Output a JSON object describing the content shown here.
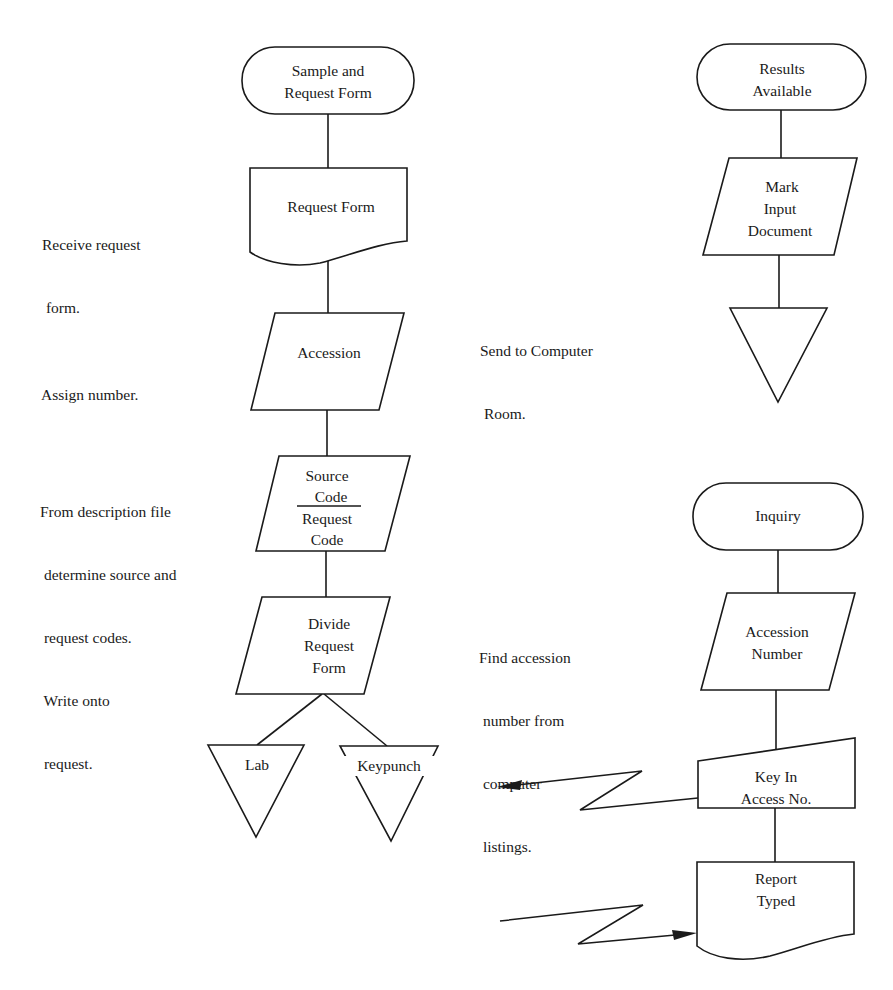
{
  "diagram": {
    "type": "flowchart",
    "palette": {
      "stroke": "#1a1a1a",
      "background": "#ffffff"
    },
    "left_flow": {
      "nodes": [
        {
          "id": "sample-request",
          "shape": "terminal",
          "lines": [
            "Sample and",
            "Request Form"
          ]
        },
        {
          "id": "request-form",
          "shape": "document",
          "lines": [
            "Request Form"
          ]
        },
        {
          "id": "accession",
          "shape": "parallelogram",
          "lines": [
            "Accession"
          ]
        },
        {
          "id": "source-request-code",
          "shape": "parallelogram",
          "lines": [
            "Source",
            "Code",
            "Request",
            "Code"
          ],
          "divider_after_line": 2
        },
        {
          "id": "divide-request-form",
          "shape": "parallelogram",
          "lines": [
            "Divide",
            "Request",
            "Form"
          ]
        },
        {
          "id": "lab",
          "shape": "offline-storage",
          "lines": [
            "Lab"
          ]
        },
        {
          "id": "keypunch",
          "shape": "offline-storage",
          "lines": [
            "Keypunch"
          ]
        }
      ],
      "notes": [
        {
          "id": "note-receive",
          "lines": [
            "Receive request",
            " form."
          ]
        },
        {
          "id": "note-assign",
          "lines": [
            "Assign number."
          ]
        },
        {
          "id": "note-description",
          "lines": [
            "From description file",
            " determine source and",
            " request codes.",
            " Write onto",
            " request."
          ]
        }
      ]
    },
    "right_flow_top": {
      "nodes": [
        {
          "id": "results-available",
          "shape": "terminal",
          "lines": [
            "Results",
            "Available"
          ]
        },
        {
          "id": "mark-input-document",
          "shape": "parallelogram",
          "lines": [
            "Mark",
            "Input",
            "Document"
          ]
        },
        {
          "id": "storage-triangle",
          "shape": "offline-storage",
          "lines": []
        }
      ],
      "notes": [
        {
          "id": "note-send",
          "lines": [
            "Send to Computer",
            " Room."
          ]
        }
      ]
    },
    "right_flow_bottom": {
      "nodes": [
        {
          "id": "inquiry",
          "shape": "terminal",
          "lines": [
            "Inquiry"
          ]
        },
        {
          "id": "accession-number",
          "shape": "parallelogram",
          "lines": [
            "Accession",
            "Number"
          ]
        },
        {
          "id": "key-in-access-no",
          "shape": "manual-input",
          "lines": [
            "Key In",
            "Access No."
          ]
        },
        {
          "id": "report-typed",
          "shape": "document",
          "lines": [
            "Report",
            "Typed"
          ]
        }
      ],
      "notes": [
        {
          "id": "note-find",
          "lines": [
            "Find accession",
            " number from",
            " computer",
            " listings."
          ]
        }
      ],
      "communication_links": [
        {
          "id": "link-out",
          "from": "key-in-access-no",
          "direction": "outgoing"
        },
        {
          "id": "link-in",
          "to": "report-typed",
          "direction": "incoming"
        }
      ]
    }
  }
}
